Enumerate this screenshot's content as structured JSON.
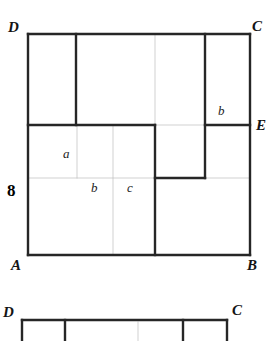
{
  "figure": {
    "kind": "geometry-diagram",
    "colors": {
      "stroke_heavy": "#262626",
      "stroke_light": "#bdbdbd",
      "background": "#ffffff",
      "text": "#141414"
    },
    "stroke_widths": {
      "heavy": 2.4,
      "light": 0.7
    }
  },
  "main_figure": {
    "name": "square-abcd",
    "outline": {
      "x": 28,
      "y": 34,
      "width": 222,
      "height": 221
    },
    "vertex_labels": [
      {
        "id": "D",
        "text": "D",
        "x": 8,
        "y": 20
      },
      {
        "id": "C",
        "text": "C",
        "x": 252,
        "y": 19
      },
      {
        "id": "E",
        "text": "E",
        "x": 256,
        "y": 118
      },
      {
        "id": "A",
        "text": "A",
        "x": 11,
        "y": 258
      },
      {
        "id": "B",
        "text": "B",
        "x": 247,
        "y": 258
      }
    ],
    "dimension_labels": [
      {
        "id": "side-AD",
        "text": "8",
        "x": 7,
        "y": 182
      }
    ],
    "segment_labels": [
      {
        "id": "a",
        "text": "a",
        "x": 63,
        "y": 147
      },
      {
        "id": "b-lower-left",
        "text": "b",
        "x": 91,
        "y": 181
      },
      {
        "id": "c",
        "text": "c",
        "x": 127,
        "y": 181
      },
      {
        "id": "b-upper-right",
        "text": "b",
        "x": 218,
        "y": 104
      }
    ],
    "heavy_lines": [
      {
        "id": "top-DC",
        "x1": 28,
        "y1": 34,
        "x2": 250,
        "y2": 34
      },
      {
        "id": "left-DA",
        "x1": 28,
        "y1": 34,
        "x2": 28,
        "y2": 255
      },
      {
        "id": "right-CB",
        "x1": 250,
        "y1": 34,
        "x2": 250,
        "y2": 255
      },
      {
        "id": "bottom-AB",
        "x1": 28,
        "y1": 255,
        "x2": 250,
        "y2": 255
      },
      {
        "id": "v-upper-left",
        "x1": 76,
        "y1": 34,
        "x2": 76,
        "y2": 125
      },
      {
        "id": "h-left-E",
        "x1": 28,
        "y1": 125,
        "x2": 155,
        "y2": 125
      },
      {
        "id": "h-right-E",
        "x1": 205,
        "y1": 125,
        "x2": 250,
        "y2": 125
      },
      {
        "id": "v-right-inner",
        "x1": 205,
        "y1": 34,
        "x2": 205,
        "y2": 178
      },
      {
        "id": "v-mid",
        "x1": 155,
        "y1": 125,
        "x2": 155,
        "y2": 255
      },
      {
        "id": "h-mid-step",
        "x1": 155,
        "y1": 178,
        "x2": 205,
        "y2": 178
      }
    ],
    "light_lines": [
      {
        "id": "g-v-155-top",
        "x1": 155,
        "y1": 34,
        "x2": 155,
        "y2": 125
      },
      {
        "id": "g-v-77",
        "x1": 77,
        "y1": 125,
        "x2": 77,
        "y2": 178
      },
      {
        "id": "g-v-113",
        "x1": 113,
        "y1": 125,
        "x2": 113,
        "y2": 255
      },
      {
        "id": "g-h-178-left",
        "x1": 28,
        "y1": 178,
        "x2": 155,
        "y2": 178
      },
      {
        "id": "g-h-178-right",
        "x1": 205,
        "y1": 178,
        "x2": 250,
        "y2": 178
      },
      {
        "id": "g-h-125-mid",
        "x1": 155,
        "y1": 125,
        "x2": 205,
        "y2": 125
      }
    ]
  },
  "secondary_figure": {
    "name": "rectangle-dc-strip",
    "outline": {
      "x": 22,
      "y": 320,
      "width": 205,
      "height": 21
    },
    "vertex_labels": [
      {
        "id": "D2",
        "text": "D",
        "x": 3,
        "y": 305
      },
      {
        "id": "C2",
        "text": "C",
        "x": 232,
        "y": 303
      }
    ],
    "heavy_lines": [
      {
        "id": "s-top",
        "x1": 22,
        "y1": 320,
        "x2": 227,
        "y2": 320
      },
      {
        "id": "s-left",
        "x1": 22,
        "y1": 320,
        "x2": 22,
        "y2": 341
      },
      {
        "id": "s-right",
        "x1": 227,
        "y1": 320,
        "x2": 227,
        "y2": 341
      },
      {
        "id": "s-v-65",
        "x1": 65,
        "y1": 320,
        "x2": 65,
        "y2": 341
      },
      {
        "id": "s-v-183",
        "x1": 183,
        "y1": 320,
        "x2": 183,
        "y2": 341
      }
    ],
    "light_lines": [
      {
        "id": "s-g-v-138",
        "x1": 138,
        "y1": 322,
        "x2": 138,
        "y2": 341
      }
    ]
  }
}
